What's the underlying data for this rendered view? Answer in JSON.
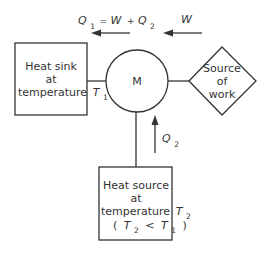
{
  "diagram": {
    "type": "heat pump / refrigerator energy flow",
    "colors": {
      "stroke": "#333333",
      "text": "#333333",
      "background": "#ffffff"
    },
    "machine": {
      "label": "M"
    },
    "heat_sink": {
      "line1": "Heat sink",
      "line2": "at",
      "line3": "temperature",
      "temp_symbol": "T",
      "temp_sub": "1"
    },
    "work_source": {
      "line1": "Source",
      "line2": "of",
      "line3": "work"
    },
    "heat_source": {
      "line1": "Heat source",
      "line2": "at",
      "line3": "temperature",
      "temp_symbol": "T",
      "temp_sub": "2",
      "condition_open": "(",
      "condition_a_symbol": "T",
      "condition_a_sub": "2",
      "condition_op": "<",
      "condition_b_symbol": "T",
      "condition_b_sub": "1",
      "condition_close": ")"
    },
    "flows": {
      "q1": {
        "symbol": "Q",
        "sub": "1",
        "eq": "=",
        "w": "W",
        "plus": "+",
        "q2_symbol": "Q",
        "q2_sub": "2",
        "direction": "left"
      },
      "w": {
        "symbol": "W",
        "direction": "left"
      },
      "q2": {
        "symbol": "Q",
        "sub": "2",
        "direction": "up"
      }
    }
  }
}
